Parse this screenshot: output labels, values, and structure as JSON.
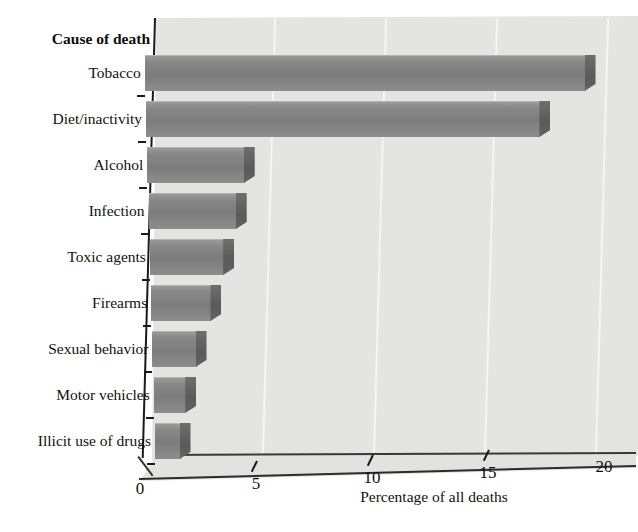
{
  "chart_data": {
    "type": "bar",
    "orientation": "horizontal",
    "title": "",
    "xlabel": "Percentage of all deaths",
    "ylabel": "Cause of death",
    "categories": [
      "Tobacco",
      "Diet/inactivity",
      "Alcohol",
      "Infection",
      "Toxic agents",
      "Firearms",
      "Sexual behavior",
      "Motor vehicles",
      "Illicit use of drugs"
    ],
    "values": [
      19,
      17,
      4.2,
      3.8,
      3.2,
      2.6,
      1.9,
      1.4,
      1.1
    ],
    "xlim": [
      0,
      20
    ],
    "xticks": [
      0,
      5,
      10,
      15,
      20
    ],
    "xtick_labels": [
      "0",
      "5",
      "10",
      "15",
      "20"
    ],
    "grid": true,
    "grid_axis": "x",
    "legend": false,
    "style_3d": true,
    "bar_color": "#808080",
    "bar_side_color": "#5a5a5a",
    "plot_background": "#e4e4e2",
    "axis_color": "#1a1a1a",
    "gridline_color": "#f6f6f4"
  }
}
